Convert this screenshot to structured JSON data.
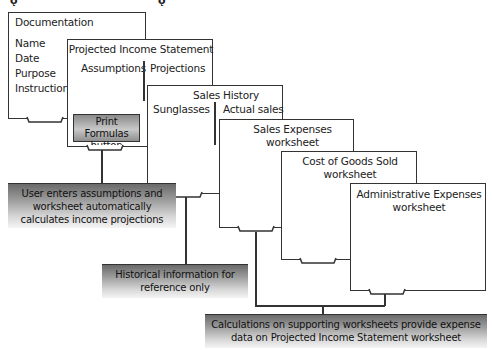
{
  "documentation": {
    "title": "Documentation",
    "items": [
      "Name",
      "Date",
      "Purpose",
      "Instructions"
    ]
  },
  "income_statement": {
    "title": "Projected Income Statement",
    "col_left": "Assumptions",
    "col_right": "Projections",
    "button_line1": "Print Formulas",
    "button_line2": "button"
  },
  "sales_history": {
    "title": "Sales History",
    "col_left": "Sunglasses",
    "col_right": "Actual sales"
  },
  "sales_expenses": {
    "line1": "Sales Expenses",
    "line2": "worksheet"
  },
  "cogs": {
    "line1": "Cost of Goods Sold",
    "line2": "worksheet"
  },
  "admin_expenses": {
    "line1": "Administrative Expenses",
    "line2": "worksheet"
  },
  "callouts": {
    "income": [
      "User enters assumptions and",
      "worksheet automatically",
      "calculates income projections"
    ],
    "history": [
      "Historical information for",
      "reference only"
    ],
    "supporting": [
      "Calculations on supporting worksheets provide expense",
      "data on Projected Income Statement worksheet"
    ]
  },
  "colors": {
    "line": "#333333",
    "callout_dark": "#6a6a6a",
    "callout_light": "#f4f4f4"
  }
}
